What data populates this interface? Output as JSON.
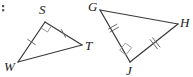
{
  "figure": {
    "background_color": "#ffffff",
    "stroke_color": "#3a3a3a",
    "tick_color": "#6a6a6a",
    "right_angle_color": "#9a9a9a",
    "label_color": "#1a1a1a"
  },
  "triangles": [
    {
      "name": "triangle-wst",
      "vertices": [
        {
          "label": "W",
          "x": 18,
          "y": 62,
          "label_x": 4,
          "label_y": 71
        },
        {
          "label": "S",
          "x": 45,
          "y": 22,
          "label_x": 39,
          "label_y": 14
        },
        {
          "label": "T",
          "x": 82,
          "y": 45,
          "label_x": 85,
          "label_y": 50
        }
      ],
      "right_angle_at": "S",
      "sides": [
        {
          "name": "WS",
          "from": "W",
          "to": "S",
          "ticks": 1
        },
        {
          "name": "ST",
          "from": "S",
          "to": "T",
          "ticks": 1
        },
        {
          "name": "WT",
          "from": "W",
          "to": "T",
          "ticks": 0
        }
      ]
    },
    {
      "name": "triangle-gjh",
      "vertices": [
        {
          "label": "G",
          "x": 100,
          "y": 10,
          "label_x": 88,
          "label_y": 11
        },
        {
          "label": "H",
          "x": 178,
          "y": 24,
          "label_x": 180,
          "label_y": 27
        },
        {
          "label": "J",
          "x": 130,
          "y": 62,
          "label_x": 126,
          "label_y": 75
        }
      ],
      "right_angle_at": "J",
      "sides": [
        {
          "name": "GJ",
          "from": "G",
          "to": "J",
          "ticks": 2
        },
        {
          "name": "JH",
          "from": "J",
          "to": "H",
          "ticks": 2
        },
        {
          "name": "GH",
          "from": "G",
          "to": "H",
          "ticks": 0
        }
      ]
    }
  ],
  "artifacts": [
    {
      "name": "corner-mark",
      "x": 2,
      "y": 5,
      "width": 4,
      "height": 7
    }
  ]
}
